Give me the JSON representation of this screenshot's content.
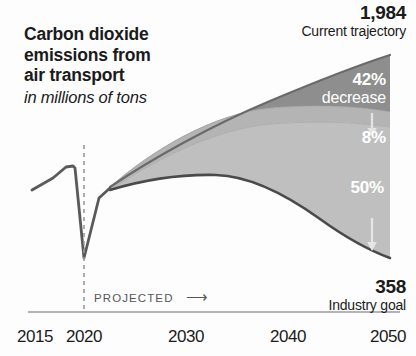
{
  "title": {
    "line1": "Carbon dioxide",
    "line2": "emissions from",
    "line3": "air transport",
    "subtitle": "in millions of tons"
  },
  "annotations": {
    "top_value": "1,984",
    "top_caption": "Current trajectory",
    "bottom_value": "358",
    "bottom_caption": "Industry goal",
    "projected": "PROJECTED",
    "projected_arrow": "⟶"
  },
  "bands": {
    "upper_pct": "42%",
    "upper_word": "decrease",
    "middle_pct": "8%",
    "lower_pct": "50%"
  },
  "colors": {
    "ink": "#1b1b1b",
    "band_upper": "#8e8e8e",
    "band_middle": "#b4b4b4",
    "band_lower": "#bfbfbf",
    "line": "#4a4a4a",
    "axis": "#9a9a9a",
    "label_white": "#ffffff",
    "projected_text": "#575757"
  },
  "chart_data": {
    "type": "area",
    "title": "Carbon dioxide emissions from air transport",
    "subtitle": "in millions of tons",
    "xlabel": "",
    "ylabel": "millions of tons",
    "xlim": [
      2015,
      2050
    ],
    "ylim": [
      0,
      2100
    ],
    "grid": false,
    "legend": "none",
    "xticks": [
      "2015",
      "2020",
      "2030",
      "2040",
      "2050"
    ],
    "xtick_values": [
      2015,
      2020,
      2030,
      2040,
      2050
    ],
    "projection_start_year": 2020,
    "historical": {
      "name": "Historical emissions",
      "x": [
        2015,
        2016,
        2017,
        2018,
        2019,
        2020,
        2021,
        2022
      ],
      "y": [
        780,
        820,
        880,
        905,
        900,
        300,
        560,
        700
      ]
    },
    "series": [
      {
        "name": "Current trajectory (upper bound)",
        "endpoint_value": 1984,
        "endpoint_label": "Current trajectory",
        "x": [
          2022,
          2025,
          2030,
          2035,
          2040,
          2045,
          2050
        ],
        "y": [
          700,
          1010,
          1290,
          1500,
          1680,
          1850,
          1984
        ]
      },
      {
        "name": "After 42% decrease (technology and operations)",
        "reduction_pct": 42,
        "reduction_label": "42% decrease",
        "x": [
          2022,
          2025,
          2030,
          2035,
          2040,
          2045,
          2050
        ],
        "y": [
          700,
          960,
          1175,
          1300,
          1360,
          1395,
          1410
        ]
      },
      {
        "name": "After additional 8% decrease (offsets)",
        "reduction_pct": 8,
        "reduction_label": "8%",
        "x": [
          2022,
          2025,
          2030,
          2035,
          2040,
          2045,
          2050
        ],
        "y": [
          700,
          935,
          1120,
          1215,
          1250,
          1265,
          1270
        ]
      },
      {
        "name": "Industry goal after remaining 50% decrease",
        "reduction_pct": 50,
        "reduction_label": "50%",
        "endpoint_value": 358,
        "endpoint_label": "Industry goal",
        "x": [
          2022,
          2025,
          2030,
          2035,
          2040,
          2045,
          2050
        ],
        "y": [
          700,
          900,
          1000,
          930,
          760,
          540,
          358
        ]
      }
    ],
    "annotations": [
      {
        "text": "1,984",
        "role": "endpoint-value",
        "at_year": 2050
      },
      {
        "text": "Current trajectory",
        "role": "endpoint-caption",
        "at_year": 2050
      },
      {
        "text": "358",
        "role": "endpoint-value",
        "at_year": 2050
      },
      {
        "text": "Industry goal",
        "role": "endpoint-caption",
        "at_year": 2050
      },
      {
        "text": "42% decrease",
        "role": "band-label"
      },
      {
        "text": "8%",
        "role": "band-label"
      },
      {
        "text": "50%",
        "role": "band-label"
      },
      {
        "text": "PROJECTED",
        "role": "axis-note",
        "at_year": 2020
      }
    ]
  },
  "xticks": [
    {
      "label": "2015",
      "x": 35
    },
    {
      "label": "2020",
      "x": 84
    },
    {
      "label": "2030",
      "x": 186
    },
    {
      "label": "2040",
      "x": 288
    },
    {
      "label": "2050",
      "x": 388
    }
  ]
}
